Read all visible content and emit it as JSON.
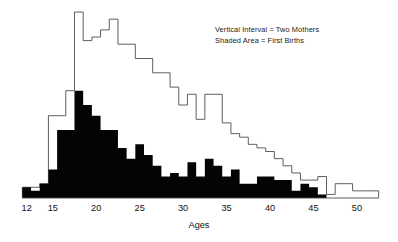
{
  "chart_data": {
    "type": "bar",
    "title": "",
    "subtitle": "",
    "xlabel": "Ages",
    "ylabel": "",
    "xlim": [
      11,
      53
    ],
    "ylim": [
      0,
      104
    ],
    "grid": false,
    "y_unit_note": "Vertical interval = two mothers",
    "legend": {
      "position": "top-right",
      "entries": [
        "Vertical Interval = Two Mothers",
        "Shaded Area = First Births"
      ]
    },
    "xticks": [
      12,
      15,
      20,
      25,
      30,
      35,
      40,
      45,
      50
    ],
    "xtick_labels": [
      "12",
      "15",
      "20",
      "25",
      "30",
      "35",
      "40",
      "45",
      "50"
    ],
    "categories": [
      12,
      13,
      14,
      15,
      16,
      17,
      18,
      19,
      20,
      21,
      22,
      23,
      24,
      25,
      26,
      27,
      28,
      29,
      30,
      31,
      32,
      33,
      34,
      35,
      36,
      37,
      38,
      39,
      40,
      41,
      42,
      43,
      44,
      45,
      46,
      47,
      48,
      49,
      50,
      51,
      52
    ],
    "series": [
      {
        "name": "All Births",
        "style": "outline",
        "color": "#4d4d4d",
        "values": [
          6,
          6,
          8,
          46,
          46,
          60,
          104,
          88,
          90,
          94,
          100,
          86,
          86,
          78,
          78,
          70,
          70,
          62,
          52,
          58,
          44,
          58,
          58,
          42,
          36,
          34,
          30,
          28,
          26,
          22,
          18,
          14,
          10,
          10,
          12,
          2,
          8,
          8,
          4,
          4,
          4
        ]
      },
      {
        "name": "First Births",
        "style": "filled",
        "color": "#040404",
        "values": [
          6,
          4,
          8,
          16,
          38,
          38,
          60,
          52,
          46,
          38,
          38,
          28,
          22,
          30,
          24,
          18,
          12,
          14,
          12,
          20,
          12,
          22,
          18,
          12,
          16,
          8,
          8,
          12,
          12,
          10,
          10,
          4,
          8,
          6,
          2,
          0,
          0,
          0,
          0,
          0,
          0
        ]
      }
    ]
  },
  "axis": {
    "x_label": "Ages"
  }
}
